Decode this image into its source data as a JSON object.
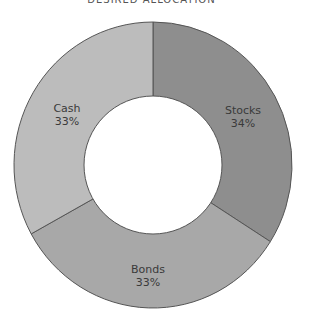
{
  "chart_data": {
    "type": "pie",
    "variant": "donut",
    "title": "DESIRED ALLOCATION",
    "categories": [
      "Stocks",
      "Bonds",
      "Cash"
    ],
    "values": [
      34,
      33,
      33
    ],
    "labels": [
      "34%",
      "33%",
      "33%"
    ],
    "colors": [
      "#8e8e8e",
      "#a8a8a8",
      "#bcbcbc"
    ],
    "start_angle_deg": 0,
    "direction": "clockwise",
    "legend": "none (inline labels)"
  },
  "title": "DESIRED ALLOCATION",
  "slices": [
    {
      "name": "Stocks",
      "pct": "34%"
    },
    {
      "name": "Bonds",
      "pct": "33%"
    },
    {
      "name": "Cash",
      "pct": "33%"
    }
  ]
}
